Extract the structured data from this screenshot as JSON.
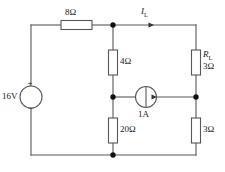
{
  "diagram": {
    "type": "electrical-schematic",
    "colors": {
      "wire": "#555555",
      "component_outline": "#555555",
      "node": "#101010",
      "text": "#1a1a1a",
      "background": "#ffffff"
    },
    "components": [
      {
        "id": "source-voltage",
        "kind": "voltage-source",
        "label": "16V",
        "plus_sign": "+",
        "minus_sign": "−",
        "position": "left-branch"
      },
      {
        "id": "resistor-8ohm",
        "kind": "resistor",
        "label": "8Ω",
        "position": "top-left-horizontal"
      },
      {
        "id": "resistor-4ohm",
        "kind": "resistor",
        "label": "4Ω",
        "position": "center-upper-vertical"
      },
      {
        "id": "resistor-20ohm",
        "kind": "resistor",
        "label": "20Ω",
        "position": "center-lower-vertical"
      },
      {
        "id": "resistor-load",
        "kind": "resistor",
        "name_label": "R",
        "name_subscript": "L",
        "value_label": "3Ω",
        "position": "right-upper-vertical"
      },
      {
        "id": "resistor-3ohm",
        "kind": "resistor",
        "label": "3Ω",
        "position": "right-lower-vertical"
      },
      {
        "id": "source-current",
        "kind": "current-source",
        "label": "1A",
        "position": "middle-horizontal",
        "arrow_direction": "right"
      }
    ],
    "annotations": [
      {
        "id": "current-il",
        "symbol": "I",
        "subscript": "L",
        "arrow_direction": "right",
        "position": "top-right-wire"
      }
    ],
    "nodes": [
      {
        "id": "node-top-center",
        "x": 113,
        "y": 25
      },
      {
        "id": "node-mid-center",
        "x": 113,
        "y": 97
      },
      {
        "id": "node-mid-right",
        "x": 196,
        "y": 97
      },
      {
        "id": "node-bottom-center",
        "x": 113,
        "y": 155
      }
    ]
  }
}
